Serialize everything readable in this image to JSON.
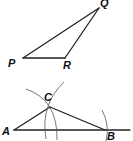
{
  "triangle_pqr": {
    "vertices": {
      "P": {
        "label": "P",
        "x": 23,
        "y": 58
      },
      "Q": {
        "label": "Q",
        "x": 99,
        "y": 8
      },
      "R": {
        "label": "R",
        "x": 65,
        "y": 58
      }
    }
  },
  "construction_abc": {
    "vertices": {
      "A": {
        "label": "A",
        "x": 14,
        "y": 130
      },
      "B": {
        "label": "B",
        "x": 105,
        "y": 130
      },
      "C": {
        "label": "C",
        "x": 50,
        "y": 107
      }
    },
    "ray_end_x": 130
  },
  "colors": {
    "line": "#222222",
    "arc": "#555555",
    "text": "#111111",
    "background": "#ffffff"
  }
}
